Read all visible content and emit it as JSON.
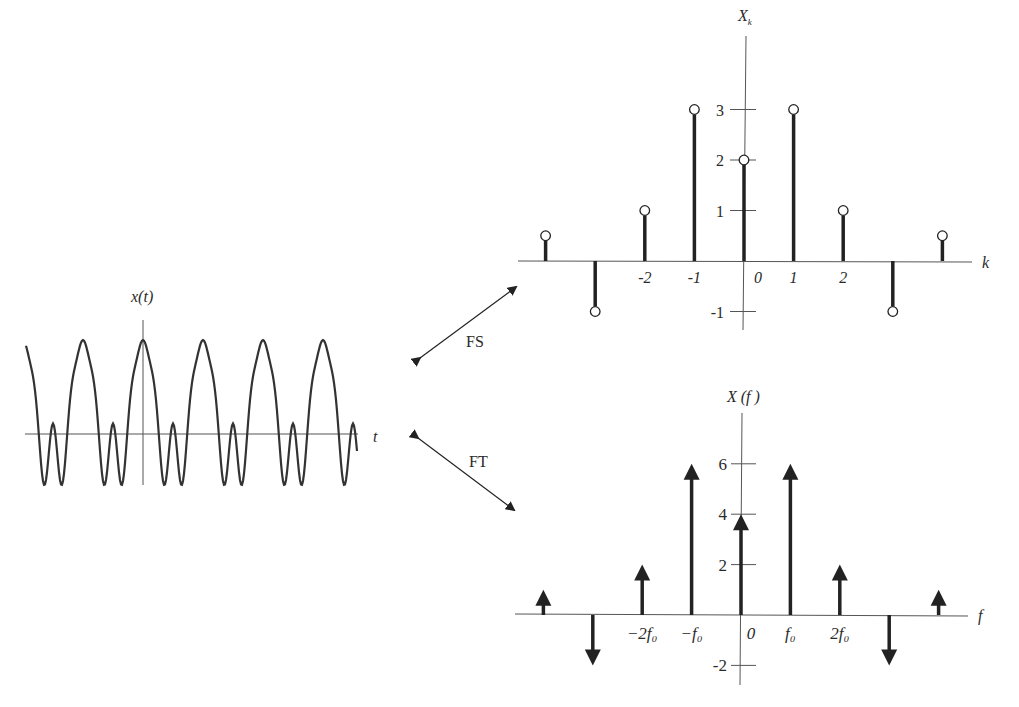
{
  "time_plot": {
    "ylabel": "x(t)",
    "xlabel": "t"
  },
  "arrows": {
    "fs_label": "FS",
    "ft_label": "FT"
  },
  "fs_plot": {
    "ylabel": "X",
    "ylabel_sub": "k",
    "xlabel": "k",
    "xticks": [
      {
        "k": -2,
        "label": "-2"
      },
      {
        "k": -1,
        "label": "-1"
      },
      {
        "k": 0,
        "label": "0"
      },
      {
        "k": 1,
        "label": "1"
      },
      {
        "k": 2,
        "label": "2"
      }
    ],
    "yticks": [
      {
        "v": 3,
        "label": "3"
      },
      {
        "v": 2,
        "label": "2"
      },
      {
        "v": 1,
        "label": "1"
      },
      {
        "v": -1,
        "label": "-1"
      }
    ]
  },
  "ft_plot": {
    "ylabel": "X (f )",
    "xlabel": "f",
    "xticks": [
      {
        "k": -2,
        "label": "−2f₀"
      },
      {
        "k": -1,
        "label": "−f₀"
      },
      {
        "k": 0,
        "label": "0"
      },
      {
        "k": 1,
        "label": "f₀"
      },
      {
        "k": 2,
        "label": "2f₀"
      }
    ],
    "yticks": [
      {
        "v": 6,
        "label": "6"
      },
      {
        "v": 4,
        "label": "4"
      },
      {
        "v": 2,
        "label": "2"
      },
      {
        "v": -2,
        "label": "-2"
      }
    ]
  },
  "chart_data": [
    {
      "type": "line",
      "title": "x(t)",
      "xlabel": "t",
      "ylabel": "x(t)",
      "description": "Periodic waveform with flat-topped positive peaks and double-dipped negative troughs; ~5.5 periods shown"
    },
    {
      "type": "stem",
      "title": "Fourier series coefficients X_k",
      "xlabel": "k",
      "ylabel": "X_k",
      "x": [
        -4,
        -3,
        -2,
        -1,
        0,
        1,
        2,
        3,
        4
      ],
      "values": [
        0.5,
        -1,
        1,
        3,
        2,
        3,
        1,
        -1,
        0.5
      ],
      "xtick_labels": [
        "-2",
        "-1",
        "0",
        "1",
        "2"
      ],
      "ytick_labels": [
        "-1",
        "1",
        "2",
        "3"
      ],
      "ylim": [
        -1.3,
        4.2
      ]
    },
    {
      "type": "impulse",
      "title": "Fourier transform X(f)",
      "xlabel": "f",
      "ylabel": "X(f)",
      "x": [
        "-4f0",
        "-3f0",
        "-2f0",
        "-f0",
        "0",
        "f0",
        "2f0",
        "3f0",
        "4f0"
      ],
      "values": [
        1,
        -2,
        2,
        6,
        4,
        6,
        2,
        -2,
        1
      ],
      "xtick_labels": [
        "-2f0",
        "-f0",
        "0",
        "f0",
        "2f0"
      ],
      "ytick_labels": [
        "-2",
        "2",
        "4",
        "6"
      ],
      "ylim": [
        -2.8,
        7.5
      ]
    }
  ]
}
